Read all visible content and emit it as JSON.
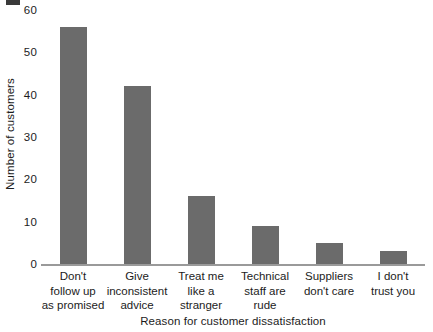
{
  "chart_data": {
    "type": "bar",
    "title": "",
    "xlabel": "Reason for customer dissatisfaction",
    "ylabel": "Number of customers",
    "categories": [
      "Don't follow up as promised",
      "Give inconsistent advice",
      "Treat me like a stranger",
      "Technical staff are rude",
      "Suppliers don't care",
      "I don't trust you"
    ],
    "category_lines": [
      [
        "Don't",
        "follow up",
        "as promised"
      ],
      [
        "Give",
        "inconsistent",
        "advice"
      ],
      [
        "Treat me",
        "like a",
        "stranger"
      ],
      [
        "Technical",
        "staff are",
        "rude"
      ],
      [
        "Suppliers",
        "don't care",
        ""
      ],
      [
        "I don't",
        "trust you",
        ""
      ]
    ],
    "values": [
      56,
      42,
      16,
      9,
      5,
      3
    ],
    "ylim": [
      0,
      60
    ],
    "yticks": [
      0,
      10,
      20,
      30,
      40,
      50,
      60
    ],
    "ytick_labels": [
      "0",
      "10",
      "20",
      "30",
      "40",
      "50",
      "60"
    ],
    "grid": false,
    "legend": false,
    "bar_color": "#6b6b6b",
    "axis_color": "#9a9a9a",
    "text_color": "#1c1c1c",
    "background": "#ffffff"
  }
}
